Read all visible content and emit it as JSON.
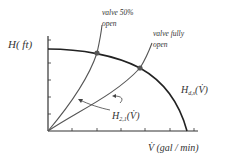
{
  "diagram": {
    "y_axis_label": "H( ft)",
    "x_axis_label": "V̇ (gal / min)",
    "curves": {
      "pump": {
        "label_main": "H",
        "label_sub": "d,s",
        "label_arg": "(V̇)"
      },
      "system": {
        "label_main": "H",
        "label_sub": "2,1",
        "label_arg": "(V̇)"
      }
    },
    "annotations": [
      {
        "line1": "valve 50%",
        "line2": "open"
      },
      {
        "line1": "valve fully",
        "line2": "open"
      }
    ],
    "colors": {
      "axis": "#333333",
      "pump_curve": "#222222",
      "system_curve": "#555555",
      "operating_point": "#555555",
      "text": "#333333"
    }
  }
}
